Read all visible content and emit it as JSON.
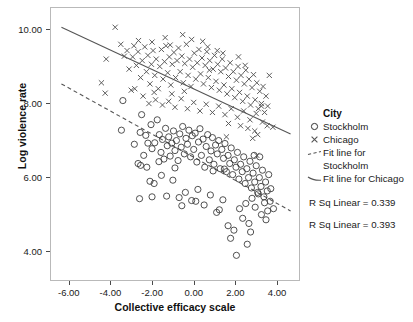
{
  "chart_data": {
    "type": "scatter",
    "title": "",
    "xlabel": "Collective efficacy scale",
    "ylabel": "Log violence rate",
    "xlim": [
      -6.9,
      5.1
    ],
    "ylim": [
      3.2,
      10.6
    ],
    "xticks": [
      -6.0,
      -4.0,
      -2.0,
      0.0,
      2.0,
      4.0
    ],
    "xtick_labels": [
      "-6.00",
      "-4.00",
      "-2.00",
      "0.00",
      "2.00",
      "4.00"
    ],
    "yticks": [
      4.0,
      6.0,
      8.0,
      10.0
    ],
    "ytick_labels": [
      "4.00",
      "6.00",
      "8.00",
      "10.00"
    ],
    "grid": false,
    "legend_position": "right",
    "legend_title": "City",
    "series": [
      {
        "name": "Stockholm",
        "marker": "circle-open",
        "color": "#333333",
        "r_sq_linear": 0.339,
        "fit_line": {
          "style": "dashed",
          "x_start": -6.4,
          "y_start": 8.55,
          "x_end": 4.6,
          "y_end": 5.12
        },
        "points": [
          [
            -3.45,
            8.1
          ],
          [
            -2.55,
            7.72
          ],
          [
            -2.9,
            6.92
          ],
          [
            -2.62,
            7.24
          ],
          [
            -2.35,
            7.16
          ],
          [
            -3.52,
            7.3
          ],
          [
            -2.72,
            6.4
          ],
          [
            -2.45,
            6.62
          ],
          [
            -2.3,
            6.3
          ],
          [
            -2.1,
            7.45
          ],
          [
            -2.05,
            6.8
          ],
          [
            -1.92,
            6.96
          ],
          [
            -1.8,
            7.58
          ],
          [
            -1.7,
            7.18
          ],
          [
            -1.62,
            6.7
          ],
          [
            -1.55,
            7.05
          ],
          [
            -1.48,
            6.52
          ],
          [
            -1.4,
            7.35
          ],
          [
            -1.32,
            6.88
          ],
          [
            -1.25,
            7.12
          ],
          [
            -1.18,
            6.6
          ],
          [
            -1.1,
            6.95
          ],
          [
            -1.02,
            7.28
          ],
          [
            -0.95,
            6.75
          ],
          [
            -0.88,
            7.02
          ],
          [
            -0.8,
            6.48
          ],
          [
            -0.72,
            7.2
          ],
          [
            -0.65,
            6.84
          ],
          [
            -0.58,
            7.4
          ],
          [
            -0.5,
            6.66
          ],
          [
            -0.42,
            7.08
          ],
          [
            -0.35,
            6.92
          ],
          [
            -0.28,
            7.3
          ],
          [
            -0.2,
            6.58
          ],
          [
            -0.12,
            7.15
          ],
          [
            -0.05,
            6.78
          ],
          [
            0.02,
            7.22
          ],
          [
            0.1,
            6.44
          ],
          [
            0.18,
            6.98
          ],
          [
            0.25,
            7.34
          ],
          [
            0.32,
            6.62
          ],
          [
            0.4,
            7.06
          ],
          [
            0.48,
            6.3
          ],
          [
            0.55,
            6.86
          ],
          [
            0.62,
            7.18
          ],
          [
            0.7,
            6.5
          ],
          [
            0.78,
            6.74
          ],
          [
            0.85,
            7.1
          ],
          [
            0.92,
            6.38
          ],
          [
            1.0,
            6.9
          ],
          [
            1.08,
            6.66
          ],
          [
            1.15,
            7.02
          ],
          [
            1.22,
            6.26
          ],
          [
            1.3,
            6.78
          ],
          [
            1.38,
            6.54
          ],
          [
            1.45,
            6.94
          ],
          [
            1.52,
            6.18
          ],
          [
            1.6,
            6.62
          ],
          [
            1.68,
            6.4
          ],
          [
            1.75,
            6.82
          ],
          [
            1.82,
            6.1
          ],
          [
            1.9,
            6.5
          ],
          [
            1.98,
            6.3
          ],
          [
            2.05,
            6.7
          ],
          [
            2.12,
            5.98
          ],
          [
            2.2,
            6.38
          ],
          [
            2.28,
            6.18
          ],
          [
            2.35,
            6.58
          ],
          [
            2.42,
            5.86
          ],
          [
            2.5,
            6.26
          ],
          [
            2.58,
            6.02
          ],
          [
            2.65,
            6.46
          ],
          [
            2.72,
            5.74
          ],
          [
            2.8,
            6.14
          ],
          [
            2.88,
            5.9
          ],
          [
            2.95,
            6.34
          ],
          [
            3.02,
            5.62
          ],
          [
            3.1,
            6.02
          ],
          [
            3.18,
            5.78
          ],
          [
            3.25,
            6.22
          ],
          [
            3.32,
            5.5
          ],
          [
            3.4,
            5.9
          ],
          [
            3.48,
            5.66
          ],
          [
            3.55,
            6.1
          ],
          [
            3.62,
            5.38
          ],
          [
            -2.6,
            6.35
          ],
          [
            -2.15,
            5.92
          ],
          [
            -1.95,
            5.86
          ],
          [
            -1.6,
            6.08
          ],
          [
            -1.35,
            5.52
          ],
          [
            -1.05,
            5.95
          ],
          [
            -0.75,
            5.48
          ],
          [
            -0.45,
            5.62
          ],
          [
            -0.15,
            5.4
          ],
          [
            0.15,
            5.7
          ],
          [
            0.45,
            5.28
          ],
          [
            0.75,
            5.55
          ],
          [
            1.05,
            5.08
          ],
          [
            1.35,
            5.42
          ],
          [
            1.6,
            4.72
          ],
          [
            1.72,
            4.38
          ],
          [
            1.88,
            4.6
          ],
          [
            2.0,
            3.92
          ],
          [
            2.15,
            5.18
          ],
          [
            2.3,
            4.92
          ],
          [
            2.45,
            5.32
          ],
          [
            2.6,
            4.78
          ],
          [
            2.75,
            5.46
          ],
          [
            2.9,
            5.22
          ],
          [
            3.05,
            5.58
          ],
          [
            3.2,
            5.02
          ],
          [
            3.35,
            5.34
          ],
          [
            3.5,
            5.12
          ],
          [
            3.65,
            5.72
          ],
          [
            3.78,
            5.18
          ],
          [
            -2.65,
            5.45
          ],
          [
            -2.05,
            5.5
          ],
          [
            -0.62,
            5.26
          ],
          [
            0.05,
            5.38
          ],
          [
            1.18,
            5.15
          ],
          [
            2.52,
            4.22
          ],
          [
            2.68,
            4.55
          ],
          [
            3.42,
            4.88
          ],
          [
            1.42,
            6.25
          ],
          [
            0.88,
            6.2
          ],
          [
            -0.95,
            6.28
          ],
          [
            -1.72,
            6.45
          ],
          [
            -2.25,
            6.95
          ],
          [
            2.85,
            6.62
          ],
          [
            3.12,
            6.58
          ]
        ]
      },
      {
        "name": "Chicago",
        "marker": "x",
        "color": "#555555",
        "r_sq_linear": 0.393,
        "fit_line": {
          "style": "solid",
          "x_start": -6.4,
          "y_start": 10.08,
          "x_end": 4.6,
          "y_end": 7.2
        },
        "points": [
          [
            -3.82,
            10.08
          ],
          [
            -4.25,
            9.22
          ],
          [
            -4.48,
            8.58
          ],
          [
            -4.3,
            8.3
          ],
          [
            -3.55,
            9.62
          ],
          [
            -3.38,
            9.3
          ],
          [
            -3.15,
            8.95
          ],
          [
            -2.98,
            9.28
          ],
          [
            -3.05,
            8.38
          ],
          [
            -2.8,
            9.05
          ],
          [
            -2.72,
            9.42
          ],
          [
            -2.6,
            8.72
          ],
          [
            -2.52,
            9.18
          ],
          [
            -2.4,
            9.55
          ],
          [
            -2.32,
            8.88
          ],
          [
            -2.25,
            9.32
          ],
          [
            -2.15,
            8.55
          ],
          [
            -2.08,
            9.08
          ],
          [
            -2.0,
            9.45
          ],
          [
            -1.92,
            8.78
          ],
          [
            -1.85,
            9.22
          ],
          [
            -1.75,
            8.42
          ],
          [
            -1.68,
            9.02
          ],
          [
            -1.6,
            9.48
          ],
          [
            -1.52,
            8.68
          ],
          [
            -1.45,
            9.15
          ],
          [
            -1.38,
            9.58
          ],
          [
            -1.3,
            8.85
          ],
          [
            -1.22,
            9.28
          ],
          [
            -1.15,
            8.52
          ],
          [
            -1.08,
            9.08
          ],
          [
            -1.0,
            9.4
          ],
          [
            -0.92,
            8.72
          ],
          [
            -0.85,
            9.18
          ],
          [
            -0.78,
            9.52
          ],
          [
            -0.7,
            8.88
          ],
          [
            -0.62,
            9.3
          ],
          [
            -0.55,
            8.58
          ],
          [
            -0.48,
            9.1
          ],
          [
            -0.4,
            9.62
          ],
          [
            -0.32,
            8.78
          ],
          [
            -0.25,
            9.22
          ],
          [
            -0.18,
            8.48
          ],
          [
            -0.1,
            9.0
          ],
          [
            -0.02,
            9.38
          ],
          [
            0.05,
            8.68
          ],
          [
            0.12,
            9.12
          ],
          [
            0.2,
            9.48
          ],
          [
            0.28,
            8.82
          ],
          [
            0.35,
            9.25
          ],
          [
            0.42,
            8.55
          ],
          [
            0.5,
            9.05
          ],
          [
            0.58,
            9.42
          ],
          [
            0.65,
            8.72
          ],
          [
            0.72,
            9.18
          ],
          [
            0.8,
            8.45
          ],
          [
            0.88,
            8.95
          ],
          [
            0.95,
            9.32
          ],
          [
            1.02,
            8.62
          ],
          [
            1.1,
            9.08
          ],
          [
            1.18,
            8.38
          ],
          [
            1.25,
            8.88
          ],
          [
            1.32,
            9.22
          ],
          [
            1.4,
            8.52
          ],
          [
            1.48,
            8.98
          ],
          [
            1.55,
            8.28
          ],
          [
            1.62,
            8.75
          ],
          [
            1.7,
            9.12
          ],
          [
            1.78,
            8.42
          ],
          [
            1.85,
            8.88
          ],
          [
            1.92,
            8.18
          ],
          [
            2.0,
            8.65
          ],
          [
            2.08,
            9.02
          ],
          [
            2.15,
            8.32
          ],
          [
            2.22,
            8.78
          ],
          [
            2.3,
            8.08
          ],
          [
            2.38,
            8.55
          ],
          [
            2.45,
            8.92
          ],
          [
            2.52,
            8.22
          ],
          [
            2.6,
            8.68
          ],
          [
            2.68,
            7.98
          ],
          [
            2.75,
            8.45
          ],
          [
            2.82,
            8.8
          ],
          [
            2.9,
            8.12
          ],
          [
            2.98,
            8.58
          ],
          [
            3.05,
            7.88
          ],
          [
            3.12,
            8.35
          ],
          [
            3.2,
            8.02
          ],
          [
            3.28,
            8.48
          ],
          [
            3.35,
            7.78
          ],
          [
            3.42,
            8.22
          ],
          [
            3.5,
            7.95
          ],
          [
            3.58,
            8.78
          ],
          [
            3.75,
            7.38
          ],
          [
            3.2,
            7.95
          ],
          [
            -2.88,
            8.42
          ],
          [
            -2.48,
            8.22
          ],
          [
            -2.2,
            8.02
          ],
          [
            -1.88,
            8.12
          ],
          [
            -1.55,
            7.98
          ],
          [
            -1.25,
            8.08
          ],
          [
            -0.95,
            7.92
          ],
          [
            -0.65,
            8.15
          ],
          [
            -0.35,
            7.88
          ],
          [
            -0.05,
            8.05
          ],
          [
            0.25,
            7.82
          ],
          [
            0.55,
            8.0
          ],
          [
            0.85,
            7.78
          ],
          [
            1.15,
            7.95
          ],
          [
            1.45,
            7.72
          ],
          [
            1.75,
            7.88
          ],
          [
            2.05,
            7.65
          ],
          [
            2.35,
            7.82
          ],
          [
            2.65,
            7.58
          ],
          [
            2.95,
            7.75
          ],
          [
            3.25,
            7.52
          ],
          [
            2.2,
            7.42
          ],
          [
            2.55,
            7.35
          ],
          [
            2.88,
            7.28
          ],
          [
            3.02,
            7.18
          ],
          [
            1.62,
            7.48
          ],
          [
            0.7,
            8.92
          ],
          [
            -0.5,
            8.35
          ],
          [
            -1.1,
            8.28
          ],
          [
            -1.95,
            8.32
          ],
          [
            -2.7,
            9.72
          ],
          [
            -1.42,
            9.8
          ],
          [
            -0.58,
            9.88
          ],
          [
            0.38,
            9.7
          ],
          [
            0.62,
            9.55
          ],
          [
            -0.15,
            9.75
          ],
          [
            1.08,
            9.45
          ],
          [
            1.35,
            9.38
          ],
          [
            2.1,
            9.28
          ],
          [
            2.42,
            9.05
          ],
          [
            -2.05,
            9.68
          ],
          [
            -1.18,
            9.6
          ],
          [
            -3.25,
            9.45
          ],
          [
            -2.92,
            9.58
          ],
          [
            3.48,
            7.42
          ],
          [
            2.78,
            7.08
          ],
          [
            1.52,
            7.12
          ],
          [
            2.98,
            6.62
          ]
        ]
      }
    ],
    "annotations": [
      "R Sq Linear = 0.339",
      "R Sq Linear = 0.393"
    ]
  },
  "legend": {
    "title": "City",
    "entries": [
      {
        "key": "circle-open-icon",
        "label": "Stockholm"
      },
      {
        "key": "x-marker-icon",
        "label": "Chicago"
      },
      {
        "key": "dashed-line-icon",
        "label": "Fit line for",
        "label_cont": "Stockholm"
      },
      {
        "key": "solid-line-icon",
        "label": "Fit line for Chicago"
      }
    ],
    "rsq_stockholm": "R Sq Linear = 0.339",
    "rsq_chicago": "R Sq Linear = 0.393"
  },
  "axes": {
    "x_title": "Collective efficacy scale",
    "y_title": "Log violence rate"
  },
  "colors": {
    "stockholm_marker": "#333333",
    "chicago_marker": "#555555",
    "fit_line": "#555555",
    "frame": "#b9b9b9",
    "text": "#1a1a1a"
  }
}
